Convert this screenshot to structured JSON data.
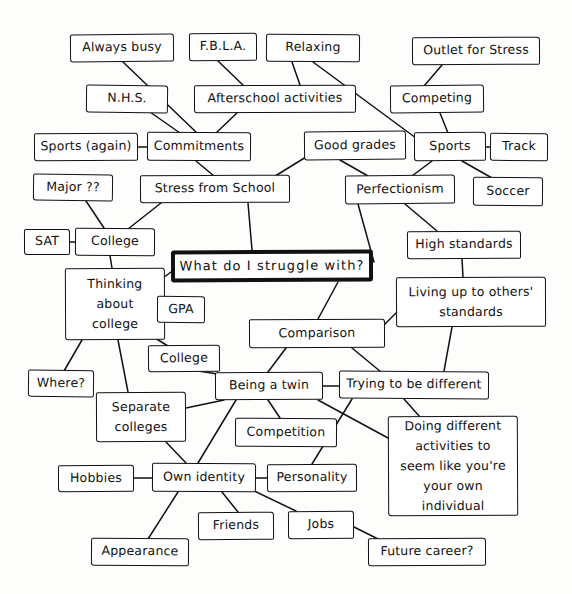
{
  "document": {
    "kind": "hand-drawn-mind-map",
    "central_question": "What do I  struggle with?",
    "ink_color": "#111111",
    "paper_color": "#fdfdfc"
  },
  "nodes": [
    {
      "id": "always_busy",
      "label": "Always busy",
      "x": 70,
      "y": 34,
      "w": 104,
      "h": 28,
      "skew": "sk1"
    },
    {
      "id": "fbla",
      "label": "F.B.L.A.",
      "x": 189,
      "y": 33,
      "w": 68,
      "h": 28,
      "skew": "sk3"
    },
    {
      "id": "relaxing",
      "label": "Relaxing",
      "x": 266,
      "y": 34,
      "w": 94,
      "h": 28,
      "skew": "sk2"
    },
    {
      "id": "outlet_for_stress",
      "label": "Outlet for Stress",
      "x": 412,
      "y": 37,
      "w": 128,
      "h": 28,
      "skew": "sk3"
    },
    {
      "id": "nhs",
      "label": "N.H.S.",
      "x": 86,
      "y": 85,
      "w": 82,
      "h": 28,
      "skew": "sk4"
    },
    {
      "id": "afterschool",
      "label": "Afterschool activities",
      "x": 194,
      "y": 85,
      "w": 162,
      "h": 28,
      "skew": "sk3"
    },
    {
      "id": "competing",
      "label": "Competing",
      "x": 390,
      "y": 85,
      "w": 94,
      "h": 28,
      "skew": "sk1"
    },
    {
      "id": "sports_again",
      "label": "Sports (again)",
      "x": 34,
      "y": 133,
      "w": 104,
      "h": 28,
      "skew": "sk3"
    },
    {
      "id": "commitments",
      "label": "Commitments",
      "x": 147,
      "y": 132,
      "w": 104,
      "h": 29,
      "skew": "sk2"
    },
    {
      "id": "good_grades",
      "label": "Good grades",
      "x": 304,
      "y": 131,
      "w": 102,
      "h": 29,
      "skew": "sk1"
    },
    {
      "id": "sports",
      "label": "Sports",
      "x": 414,
      "y": 132,
      "w": 72,
      "h": 29,
      "skew": "sk3"
    },
    {
      "id": "track",
      "label": "Track",
      "x": 490,
      "y": 133,
      "w": 58,
      "h": 28,
      "skew": "sk2"
    },
    {
      "id": "major",
      "label": "Major ??",
      "x": 33,
      "y": 174,
      "w": 80,
      "h": 27,
      "skew": "sk4"
    },
    {
      "id": "stress_from_school",
      "label": "Stress from School",
      "x": 140,
      "y": 175,
      "w": 150,
      "h": 28,
      "skew": "sk3"
    },
    {
      "id": "perfectionism",
      "label": "Perfectionism",
      "x": 345,
      "y": 175,
      "w": 110,
      "h": 29,
      "skew": "sk1"
    },
    {
      "id": "soccer",
      "label": "Soccer",
      "x": 473,
      "y": 177,
      "w": 70,
      "h": 29,
      "skew": "sk2"
    },
    {
      "id": "sat",
      "label": "SAT",
      "x": 24,
      "y": 229,
      "w": 46,
      "h": 26,
      "skew": "sk3"
    },
    {
      "id": "college_top",
      "label": "College",
      "x": 75,
      "y": 228,
      "w": 80,
      "h": 28,
      "skew": "sk2"
    },
    {
      "id": "high_standards",
      "label": "High standards",
      "x": 407,
      "y": 231,
      "w": 114,
      "h": 28,
      "skew": "sk3"
    },
    {
      "id": "central",
      "label": "What do I  struggle with?",
      "x": 171,
      "y": 250,
      "w": 202,
      "h": 32,
      "skew": "sk3",
      "central": true
    },
    {
      "id": "thinking_college",
      "label": "Thinking\nabout\ncollege",
      "x": 65,
      "y": 268,
      "w": 100,
      "h": 72,
      "skew": "sk3",
      "multiline": true
    },
    {
      "id": "living_up",
      "label": "Living up to others'\nstandards",
      "x": 396,
      "y": 277,
      "w": 150,
      "h": 50,
      "skew": "sk3",
      "multiline": true
    },
    {
      "id": "gpa",
      "label": "GPA",
      "x": 157,
      "y": 296,
      "w": 48,
      "h": 27,
      "skew": "sk2"
    },
    {
      "id": "comparison",
      "label": "Comparison",
      "x": 249,
      "y": 319,
      "w": 136,
      "h": 29,
      "skew": "sk3"
    },
    {
      "id": "college_mid",
      "label": "College",
      "x": 148,
      "y": 345,
      "w": 72,
      "h": 27,
      "skew": "sk1"
    },
    {
      "id": "where",
      "label": "Where?",
      "x": 28,
      "y": 370,
      "w": 66,
      "h": 27,
      "skew": "sk4"
    },
    {
      "id": "being_a_twin",
      "label": "Being a twin",
      "x": 215,
      "y": 372,
      "w": 108,
      "h": 28,
      "skew": "sk3"
    },
    {
      "id": "trying_different",
      "label": "Trying to be different",
      "x": 339,
      "y": 371,
      "w": 150,
      "h": 28,
      "skew": "sk2"
    },
    {
      "id": "separate_colleges",
      "label": "Separate\ncolleges",
      "x": 96,
      "y": 392,
      "w": 90,
      "h": 50,
      "skew": "sk3",
      "multiline": true
    },
    {
      "id": "doing_different",
      "label": "Doing different\nactivities  to\nseem like you're\nyour own individual",
      "x": 388,
      "y": 416,
      "w": 130,
      "h": 100,
      "skew": "sk3",
      "multiline": true
    },
    {
      "id": "competition",
      "label": "Competition",
      "x": 235,
      "y": 418,
      "w": 102,
      "h": 29,
      "skew": "sk2"
    },
    {
      "id": "hobbies",
      "label": "Hobbies",
      "x": 58,
      "y": 465,
      "w": 76,
      "h": 27,
      "skew": "sk3"
    },
    {
      "id": "own_identity",
      "label": "Own identity",
      "x": 152,
      "y": 463,
      "w": 104,
      "h": 29,
      "skew": "sk2"
    },
    {
      "id": "personality",
      "label": "Personality",
      "x": 267,
      "y": 464,
      "w": 90,
      "h": 28,
      "skew": "sk3"
    },
    {
      "id": "friends",
      "label": "Friends",
      "x": 198,
      "y": 512,
      "w": 76,
      "h": 28,
      "skew": "sk1"
    },
    {
      "id": "jobs",
      "label": "Jobs",
      "x": 288,
      "y": 511,
      "w": 66,
      "h": 28,
      "skew": "sk3"
    },
    {
      "id": "appearance",
      "label": "Appearance",
      "x": 91,
      "y": 538,
      "w": 98,
      "h": 28,
      "skew": "sk2"
    },
    {
      "id": "future_career",
      "label": "Future career?",
      "x": 368,
      "y": 538,
      "w": 118,
      "h": 28,
      "skew": "sk3"
    }
  ],
  "edges": [
    {
      "from": "always_busy",
      "to": "commitments",
      "path": "M 123 62 L 196 132"
    },
    {
      "from": "fbla",
      "to": "afterschool",
      "path": "M 218 61 L 244 86"
    },
    {
      "from": "relaxing",
      "to": "afterschool",
      "path": "M 292 62 L 300 85"
    },
    {
      "from": "relaxing",
      "to": "sports",
      "path": "M 313 62 L 420 141"
    },
    {
      "from": "outlet_for_stress",
      "to": "competing",
      "path": "M 442 65 L 424 86"
    },
    {
      "from": "nhs",
      "to": "commitments",
      "path": "M 150 112 L 180 133"
    },
    {
      "from": "afterschool",
      "to": "commitments",
      "path": "M 238 112 L 216 133"
    },
    {
      "from": "competing",
      "to": "sports",
      "path": "M 440 113 L 448 133"
    },
    {
      "from": "sports_again",
      "to": "commitments",
      "path": "M 138 147 L 147 147"
    },
    {
      "from": "commitments",
      "to": "stress_from_school",
      "path": "M 196 161 L 214 176"
    },
    {
      "from": "good_grades",
      "to": "stress_from_school",
      "path": "M 306 157 L 272 178"
    },
    {
      "from": "good_grades",
      "to": "perfectionism",
      "path": "M 340 160 L 368 176"
    },
    {
      "from": "sports",
      "to": "track",
      "path": "M 486 147 L 490 147"
    },
    {
      "from": "sports",
      "to": "perfectionism",
      "path": "M 432 161 L 412 176"
    },
    {
      "from": "sports",
      "to": "soccer",
      "path": "M 462 161 L 492 178"
    },
    {
      "from": "major",
      "to": "college_top",
      "path": "M 86 201 L 104 228"
    },
    {
      "from": "stress_from_school",
      "to": "college_top",
      "path": "M 161 203 L 128 229"
    },
    {
      "from": "stress_from_school",
      "to": "central",
      "path": "M 248 203 L 252 250"
    },
    {
      "from": "perfectionism",
      "to": "central",
      "path": "M 358 204 L 374 262"
    },
    {
      "from": "perfectionism",
      "to": "high_standards",
      "path": "M 405 204 L 437 231"
    },
    {
      "from": "sat",
      "to": "college_top",
      "path": "M 70 242 L 75 242"
    },
    {
      "from": "college_top",
      "to": "thinking_college",
      "path": "M 110 256 L 112 268"
    },
    {
      "from": "high_standards",
      "to": "living_up",
      "path": "M 462 259 L 463 277"
    },
    {
      "from": "central",
      "to": "thinking_college",
      "path": "M 171 272 L 152 286"
    },
    {
      "from": "central",
      "to": "comparison",
      "path": "M 338 282 L 318 319"
    },
    {
      "from": "thinking_college",
      "to": "gpa",
      "path": "M 165 308 L 157 309"
    },
    {
      "from": "thinking_college",
      "to": "where",
      "path": "M 82 340 L 64 371"
    },
    {
      "from": "thinking_college",
      "to": "separate_colleges",
      "path": "M 118 340 L 128 392"
    },
    {
      "from": "thinking_college",
      "to": "college_mid",
      "path": "M 155 338 L 168 346"
    },
    {
      "from": "living_up",
      "to": "trying_different",
      "path": "M 452 327 L 444 371"
    },
    {
      "from": "living_up",
      "to": "comparison",
      "path": "M 396 313 L 379 330"
    },
    {
      "from": "comparison",
      "to": "being_a_twin",
      "path": "M 286 348 L 268 372"
    },
    {
      "from": "comparison",
      "to": "trying_different",
      "path": "M 352 348 L 381 372"
    },
    {
      "from": "college_mid",
      "to": "being_a_twin",
      "path": "M 198 371 L 218 374"
    },
    {
      "from": "being_a_twin",
      "to": "trying_different",
      "path": "M 323 386 L 339 386"
    },
    {
      "from": "being_a_twin",
      "to": "separate_colleges",
      "path": "M 224 400 L 186 408"
    },
    {
      "from": "being_a_twin",
      "to": "competition",
      "path": "M 268 400 L 280 418"
    },
    {
      "from": "being_a_twin",
      "to": "own_identity",
      "path": "M 236 400 L 198 463"
    },
    {
      "from": "being_a_twin",
      "to": "doing_different",
      "path": "M 318 400 L 388 438"
    },
    {
      "from": "trying_different",
      "to": "doing_different",
      "path": "M 404 399 L 420 417"
    },
    {
      "from": "trying_different",
      "to": "personality",
      "path": "M 352 399 L 312 464"
    },
    {
      "from": "separate_colleges",
      "to": "own_identity",
      "path": "M 166 442 L 186 463"
    },
    {
      "from": "hobbies",
      "to": "own_identity",
      "path": "M 134 478 L 152 478"
    },
    {
      "from": "own_identity",
      "to": "personality",
      "path": "M 256 478 L 267 478"
    },
    {
      "from": "own_identity",
      "to": "friends",
      "path": "M 222 492 L 238 512"
    },
    {
      "from": "own_identity",
      "to": "jobs",
      "path": "M 252 490 L 296 511"
    },
    {
      "from": "own_identity",
      "to": "appearance",
      "path": "M 178 492 L 148 539"
    },
    {
      "from": "jobs",
      "to": "future_career",
      "path": "M 354 527 L 380 540"
    }
  ]
}
